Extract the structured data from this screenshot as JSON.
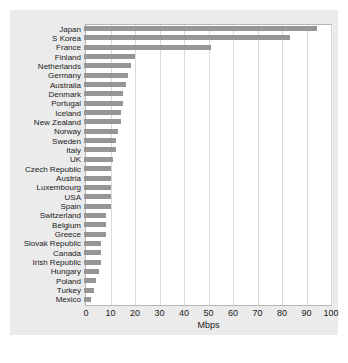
{
  "chart_data": {
    "type": "bar",
    "orientation": "horizontal",
    "title": "",
    "xlabel": "Mbps",
    "ylabel": "",
    "xlim": [
      0,
      100
    ],
    "xticks": [
      0,
      10,
      20,
      30,
      40,
      50,
      60,
      70,
      80,
      90,
      100
    ],
    "grid": true,
    "legend": false,
    "bar_color": "#969696",
    "plot_background": "#ffffff",
    "panel_background": "#ebebeb",
    "categories": [
      "Japan",
      "S Korea",
      "France",
      "Finland",
      "Netherlands",
      "Germany",
      "Australia",
      "Denmark",
      "Portugal",
      "Iceland",
      "New Zealand",
      "Norway",
      "Sweden",
      "Italy",
      "UK",
      "Czech Republic",
      "Austria",
      "Luxembourg",
      "USA",
      "Spain",
      "Switzerland",
      "Belgium",
      "Greece",
      "Slovak Republic",
      "Canada",
      "Irish Republic",
      "Hungary",
      "Poland",
      "Turkey",
      "Mexico"
    ],
    "values": [
      95,
      84,
      52,
      21,
      19,
      18,
      17,
      16,
      16,
      15,
      15,
      14,
      13,
      13,
      12,
      11,
      11,
      11,
      11,
      11,
      9,
      9,
      9,
      7,
      7,
      7,
      6,
      5,
      4,
      3
    ]
  },
  "axis": {
    "tick_labels": [
      "0",
      "10",
      "20",
      "30",
      "40",
      "50",
      "60",
      "70",
      "80",
      "90",
      "100"
    ],
    "x_title": "Mbps"
  },
  "caption": {
    "text": ""
  }
}
